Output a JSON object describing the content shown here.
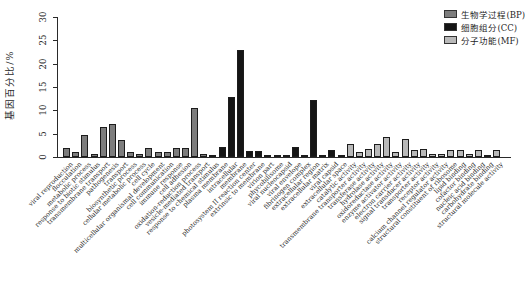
{
  "chart_data": {
    "type": "bar",
    "title": "",
    "xlabel": "",
    "ylabel": "基因百分比/%",
    "ylim": [
      0,
      30
    ],
    "yticks": [
      0,
      5,
      10,
      15,
      20,
      25,
      30
    ],
    "grid": false,
    "legend_position": "top-right",
    "groups": {
      "BP": "#7d7d7d",
      "CC": "#151515",
      "MF": "#b9b9b9"
    },
    "legend": [
      {
        "label": "生物学过程(BP)",
        "group": "BP",
        "color": "#7d7d7d"
      },
      {
        "label": "细胞组分(CC)",
        "group": "CC",
        "color": "#151515"
      },
      {
        "label": "分子功能(MF)",
        "group": "MF",
        "color": "#b9b9b9"
      }
    ],
    "bars": [
      {
        "label": "viral reproduction",
        "group": "BP",
        "value": 2.0
      },
      {
        "label": "flocculation",
        "group": "BP",
        "value": 1.0
      },
      {
        "label": "metabolic process",
        "group": "BP",
        "value": 4.8
      },
      {
        "label": "response to biotic stimulus",
        "group": "BP",
        "value": 0.6
      },
      {
        "label": "transmembrane transport",
        "group": "BP",
        "value": 6.5
      },
      {
        "label": "pathogenesis",
        "group": "BP",
        "value": 7.0
      },
      {
        "label": "transport",
        "group": "BP",
        "value": 3.7
      },
      {
        "label": "biosynthetic process",
        "group": "BP",
        "value": 1.0
      },
      {
        "label": "cellular metabolic process",
        "group": "BP",
        "value": 0.6
      },
      {
        "label": "cell cycle",
        "group": "BP",
        "value": 2.0
      },
      {
        "label": "multicellular organismal development",
        "group": "BP",
        "value": 1.0
      },
      {
        "label": "cell communication",
        "group": "BP",
        "value": 1.0
      },
      {
        "label": "immune response",
        "group": "BP",
        "value": 2.0
      },
      {
        "label": "cell adhesion",
        "group": "BP",
        "value": 2.0
      },
      {
        "label": "oxidation-reduction process",
        "group": "BP",
        "value": 10.6
      },
      {
        "label": "vesicle-mediated transport",
        "group": "BP",
        "value": 0.6
      },
      {
        "label": "response to chemical stimulus",
        "group": "BP",
        "value": 0.5
      },
      {
        "label": "plasma membrane",
        "group": "CC",
        "value": 2.2
      },
      {
        "label": "intracellular",
        "group": "CC",
        "value": 12.8
      },
      {
        "label": "membrane",
        "group": "CC",
        "value": 23.0
      },
      {
        "label": "photosystem II reaction center",
        "group": "CC",
        "value": 1.2
      },
      {
        "label": "extrinsic to membrane",
        "group": "CC",
        "value": 1.2
      },
      {
        "label": "virion part",
        "group": "CC",
        "value": 0.5
      },
      {
        "label": "phycobilisome",
        "group": "CC",
        "value": 0.5
      },
      {
        "label": "viral nucleocapsid",
        "group": "CC",
        "value": 0.5
      },
      {
        "label": "viral envelope",
        "group": "CC",
        "value": 2.2
      },
      {
        "label": "fibrinogen complex",
        "group": "CC",
        "value": 0.5
      },
      {
        "label": "extracellular region",
        "group": "CC",
        "value": 12.3
      },
      {
        "label": "extracellular matrix",
        "group": "CC",
        "value": 0.5
      },
      {
        "label": "viral capsid",
        "group": "CC",
        "value": 1.5
      },
      {
        "label": "extracellular space",
        "group": "CC",
        "value": 0.4
      },
      {
        "label": "catalytic activity",
        "group": "MF",
        "value": 2.8
      },
      {
        "label": "transmembrane transporter activity",
        "group": "MF",
        "value": 1.0
      },
      {
        "label": "transferase activity",
        "group": "MF",
        "value": 1.8
      },
      {
        "label": "hydrolase activity",
        "group": "MF",
        "value": 2.7
      },
      {
        "label": "oxidoreductase activity",
        "group": "MF",
        "value": 4.2
      },
      {
        "label": "enzyme activator activity",
        "group": "MF",
        "value": 1.0
      },
      {
        "label": "electron carrier activity",
        "group": "MF",
        "value": 3.9
      },
      {
        "label": "signal transducer activity",
        "group": "MF",
        "value": 1.5
      },
      {
        "label": "transporter activity",
        "group": "MF",
        "value": 1.7
      },
      {
        "label": "receptor activity",
        "group": "MF",
        "value": 0.7
      },
      {
        "label": "calcium channel regulator activity",
        "group": "MF",
        "value": 0.6
      },
      {
        "label": "structural constituent of ribosome",
        "group": "MF",
        "value": 1.4
      },
      {
        "label": "lipid binding",
        "group": "MF",
        "value": 1.5
      },
      {
        "label": "cofactor binding",
        "group": "MF",
        "value": 0.7
      },
      {
        "label": "nucleic acid binding",
        "group": "MF",
        "value": 1.5
      },
      {
        "label": "carbohydrate binding",
        "group": "MF",
        "value": 0.5
      },
      {
        "label": "structural molecule activity",
        "group": "MF",
        "value": 1.5
      }
    ]
  }
}
